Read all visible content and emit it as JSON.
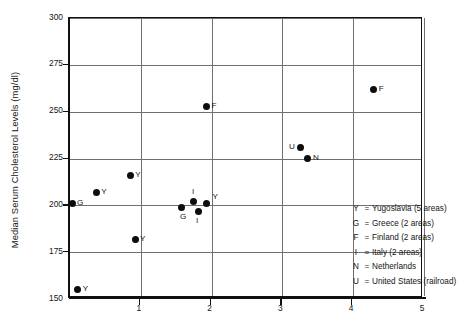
{
  "axes": {
    "ylabel": "Median Serum Cholesterol Levels (mg/dl)",
    "xlabel": "",
    "yticks": [
      "300",
      "275",
      "250",
      "225",
      "200",
      "175",
      "150"
    ],
    "xticks": [
      "1",
      "2",
      "3",
      "4",
      "5"
    ]
  },
  "legend": {
    "rows": [
      {
        "key": "Y",
        "eq": "=",
        "text": "Yugoslavia (5 areas)"
      },
      {
        "key": "G",
        "eq": "=",
        "text": "Greece (2 areas)"
      },
      {
        "key": "F",
        "eq": "=",
        "text": "Finland (2 areas)"
      },
      {
        "key": "I",
        "eq": "=",
        "text": "Italy (2 areas)"
      },
      {
        "key": "N",
        "eq": "=",
        "text": "Netherlands"
      },
      {
        "key": "U",
        "eq": "=",
        "text": "United States (railroad)"
      }
    ]
  },
  "chart_data": {
    "type": "scatter",
    "title": "",
    "xlabel": "",
    "ylabel": "Median Serum Cholesterol Levels (mg/dl)",
    "xlim": [
      0,
      5
    ],
    "ylim": [
      150,
      300
    ],
    "xtick_values": [
      1,
      2,
      3,
      4,
      5
    ],
    "ytick_values": [
      150,
      175,
      200,
      225,
      250,
      275,
      300
    ],
    "grid": true,
    "legend_position": "inside-lower-right",
    "point_label_position": "right",
    "points": [
      {
        "label": "Y",
        "country": "Yugoslavia",
        "x": 0.11,
        "y": 155,
        "lx": "right"
      },
      {
        "label": "G",
        "country": "Greece",
        "x": 0.03,
        "y": 201,
        "lx": "right"
      },
      {
        "label": "Y",
        "country": "Yugoslavia",
        "x": 0.37,
        "y": 207,
        "lx": "right"
      },
      {
        "label": "Y",
        "country": "Yugoslavia",
        "x": 0.85,
        "y": 216,
        "lx": "right"
      },
      {
        "label": "Y",
        "country": "Yugoslavia",
        "x": 0.92,
        "y": 182,
        "lx": "right"
      },
      {
        "label": "G",
        "country": "Greece",
        "x": 1.58,
        "y": 199,
        "lx": "below"
      },
      {
        "label": "I",
        "country": "Italy",
        "x": 1.75,
        "y": 202,
        "lx": "above"
      },
      {
        "label": "I",
        "country": "Italy",
        "x": 1.81,
        "y": 197,
        "lx": "below"
      },
      {
        "label": "Y",
        "country": "Yugoslavia",
        "x": 1.93,
        "y": 201,
        "lx": "right-up"
      },
      {
        "label": "F",
        "country": "Finland",
        "x": 1.93,
        "y": 253,
        "lx": "right"
      },
      {
        "label": "U",
        "country": "United States (railroad)",
        "x": 3.25,
        "y": 231,
        "lx": "left"
      },
      {
        "label": "N",
        "country": "Netherlands",
        "x": 3.36,
        "y": 225,
        "lx": "right"
      },
      {
        "label": "F",
        "country": "Finland",
        "x": 4.29,
        "y": 262,
        "lx": "right"
      }
    ]
  }
}
